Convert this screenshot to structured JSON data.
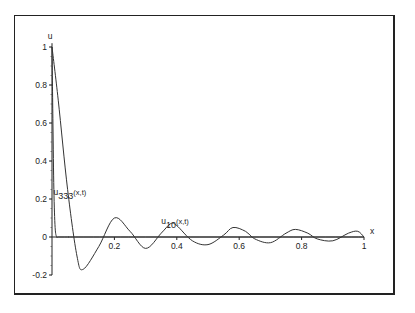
{
  "chart_data": {
    "type": "line",
    "title": "",
    "xlabel": "x",
    "ylabel": "u",
    "xlim": [
      0,
      1
    ],
    "ylim": [
      -0.2,
      1
    ],
    "x_ticks": [
      "0.2",
      "0.4",
      "0.6",
      "0.8",
      "1"
    ],
    "y_ticks": [
      "-0.2",
      "0",
      "0.2",
      "0.4",
      "0.6",
      "0.8",
      "1"
    ],
    "grid": false,
    "legend": null,
    "annotations": [
      {
        "text": "u",
        "sub": "333",
        "suffix": "(x,t)",
        "x": 0.005,
        "y": 0.22
      },
      {
        "text": "u",
        "sub": "10",
        "suffix": "(x,t)",
        "x": 0.35,
        "y": 0.07
      }
    ],
    "series": [
      {
        "name": "u_333(x,t)",
        "x": [
          0,
          0.003,
          0.006,
          0.01,
          0.015,
          0.02,
          0.05,
          0.1,
          0.5,
          1.0
        ],
        "y": [
          1.0,
          0.6,
          0.25,
          0.05,
          0.0,
          0.0,
          0.0,
          0.0,
          0.0,
          0.0
        ]
      },
      {
        "name": "u_10(x,t)",
        "x": [
          0,
          0.02,
          0.05,
          0.08,
          0.1,
          0.15,
          0.2,
          0.25,
          0.3,
          0.35,
          0.38,
          0.4,
          0.45,
          0.5,
          0.55,
          0.58,
          0.62,
          0.65,
          0.7,
          0.75,
          0.78,
          0.82,
          0.85,
          0.9,
          0.95,
          0.98,
          1.0
        ],
        "y": [
          1.0,
          0.72,
          0.25,
          -0.1,
          -0.17,
          -0.05,
          0.1,
          0.03,
          -0.06,
          0.02,
          0.07,
          0.06,
          -0.02,
          -0.04,
          0.01,
          0.05,
          0.03,
          -0.01,
          -0.03,
          0.02,
          0.04,
          0.02,
          -0.01,
          -0.02,
          0.02,
          0.03,
          0.0
        ]
      }
    ]
  }
}
